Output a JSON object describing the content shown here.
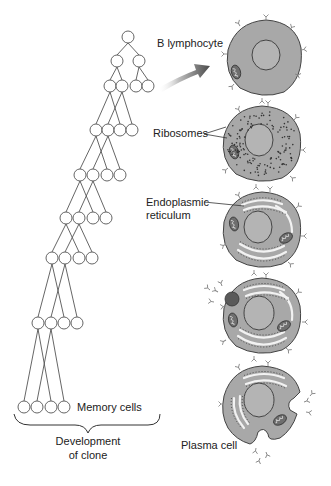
{
  "diagram": {
    "labels": {
      "b_lymphocyte": "B lymphocyte",
      "ribosomes": "Ribosomes",
      "endoplasmic_line1": "Endoplasmic",
      "endoplasmic_line2": "reticulum",
      "memory_cells": "Memory cells",
      "development_line1": "Development",
      "development_line2": "of clone",
      "plasma_cell": "Plasma cell"
    },
    "tree": {
      "levels": [
        [
          128
        ],
        [
          117,
          139
        ],
        [
          110,
          122,
          136,
          148
        ],
        [
          96,
          108,
          120,
          132
        ],
        [
          80,
          93,
          107,
          120
        ],
        [
          66,
          79,
          93,
          106
        ],
        [
          52,
          65,
          79,
          92
        ],
        [
          38,
          51,
          64,
          77
        ],
        [
          24,
          37,
          51,
          64
        ]
      ],
      "level_y": [
        37,
        61,
        86,
        130,
        175,
        218,
        258,
        323,
        407
      ]
    },
    "cells": [
      {
        "stage": "B lymphocyte",
        "cx": 264,
        "cy": 58
      },
      {
        "stage": "Ribosome development",
        "cx": 262,
        "cy": 144
      },
      {
        "stage": "Endoplasmic reticulum development",
        "cx": 262,
        "cy": 230
      },
      {
        "stage": "Antibody secretion begins",
        "cx": 262,
        "cy": 316
      },
      {
        "stage": "Plasma cell",
        "cx": 262,
        "cy": 404
      }
    ],
    "colors": {
      "cell_fill": "#a8a8a8",
      "nucleus_fill": "#b4b4b4",
      "outline": "#444444",
      "er": "#f2f2f2",
      "arrow_dark": "#4a4a4a",
      "line": "#555555"
    }
  }
}
